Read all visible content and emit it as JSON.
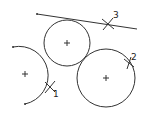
{
  "diagram": {
    "line": {
      "x1": 37,
      "y1": 14,
      "x2": 137,
      "y2": 29
    },
    "circles": [
      {
        "id": "top",
        "cx": 67,
        "cy": 43,
        "r": 23
      },
      {
        "id": "right",
        "cx": 106,
        "cy": 78,
        "r": 29
      }
    ],
    "arc": {
      "id": "left",
      "cx": 25,
      "cy": 74,
      "r": 28,
      "start": [
        13,
        47
      ],
      "end": [
        25,
        104
      ]
    },
    "markers": [
      {
        "label": "1",
        "x": 50,
        "y": 87,
        "lx": 53,
        "ly": 97
      },
      {
        "label": "2",
        "x": 129,
        "y": 63,
        "lx": 131,
        "ly": 60
      },
      {
        "label": "3",
        "x": 108,
        "y": 24,
        "lx": 113,
        "ly": 18
      }
    ]
  }
}
